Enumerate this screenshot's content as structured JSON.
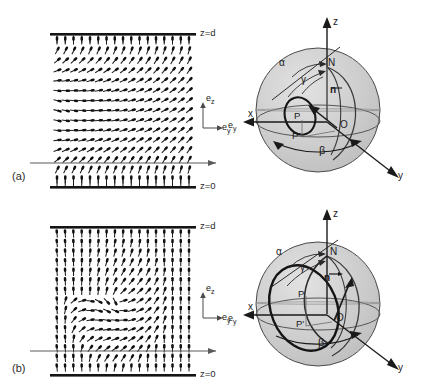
{
  "figure": {
    "kind": "two-panel scientific diagram"
  },
  "panels": [
    {
      "id": "a",
      "label": "(a)",
      "field": {
        "top_plate_label": "z=d",
        "bottom_plate_label": "z=0",
        "axis_key": {
          "vertical": "e",
          "vertical_sub": "z",
          "horizontal": "e",
          "horizontal_sub": "y"
        },
        "grid_cols": 17,
        "grid_rows": 15,
        "note": "director rods rotate from vertical at plates to near-horizontal mid-cell, symmetric splay-twist"
      },
      "sphere": {
        "axis_labels": {
          "z": "z",
          "x": "x",
          "y": "y",
          "ey": "e",
          "ey_sub": "y"
        },
        "point_labels": {
          "north": "N",
          "origin": "O",
          "p": "P",
          "p_prime": "P'"
        },
        "vector_label": "n",
        "angle_labels": {
          "alpha": "α",
          "beta": "β",
          "gamma": "γ"
        },
        "loop": "small"
      }
    },
    {
      "id": "b",
      "label": "(b)",
      "field": {
        "top_plate_label": "z=d",
        "bottom_plate_label": "z=0",
        "axis_key": {
          "vertical": "e",
          "vertical_sub": "z",
          "horizontal": "e",
          "horizontal_sub": "y"
        },
        "grid_cols": 17,
        "grid_rows": 15,
        "note": "director rods stay vertical near left and right edges, large twisted bubble in the centre"
      },
      "sphere": {
        "axis_labels": {
          "z": "z",
          "x": "x",
          "y": "y",
          "ey": "e",
          "ey_sub": "y"
        },
        "point_labels": {
          "north": "N",
          "origin": "O",
          "p": "P",
          "p_prime": "P'"
        },
        "vector_label": "n",
        "angle_labels": {
          "alpha": "α",
          "beta": "β",
          "gamma": "γ"
        },
        "loop": "large"
      }
    }
  ],
  "colors": {
    "ink": "#1a1a1a",
    "sphere_fill": "#c9c9c9",
    "sphere_fill_light": "#d8d8d8",
    "sphere_line": "#3a3a3a",
    "plate": "#141414",
    "background": "#ffffff"
  }
}
